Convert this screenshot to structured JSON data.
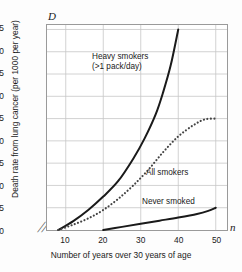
{
  "chart_data": {
    "type": "line",
    "title": "",
    "xlabel": "Number of years over 30 years of age",
    "ylabel": "Death rate from lung cancer (per 1000 per year)",
    "x_symbol": "n",
    "y_symbol": "D",
    "xlim": [
      5,
      53
    ],
    "ylim": [
      0,
      46
    ],
    "xticks": [
      10,
      20,
      30,
      40,
      50
    ],
    "yticks": [
      0,
      5,
      10,
      15,
      20,
      25,
      30,
      35,
      40,
      45
    ],
    "grid": true,
    "legend_position": "inline-annotations",
    "axis_break": "╱╱",
    "series": [
      {
        "name": "Heavy smokers",
        "name_line2": "(>1 pack/day)",
        "style": "solid",
        "color": "#1a1a1a",
        "x": [
          8,
          12,
          16,
          20,
          24,
          28,
          31,
          34,
          36,
          38,
          40
        ],
        "values": [
          0,
          2,
          4.5,
          7.5,
          11,
          16,
          20.5,
          26,
          31,
          37,
          45
        ]
      },
      {
        "name": "All smokers",
        "style": "dotted",
        "color": "#444444",
        "x": [
          8,
          12,
          16,
          20,
          24,
          28,
          32,
          36,
          40,
          44,
          47,
          50
        ],
        "values": [
          0,
          1.2,
          2.6,
          4.5,
          7,
          10,
          13.5,
          17.5,
          21,
          23.5,
          24.8,
          25
        ]
      },
      {
        "name": "Never smoked",
        "style": "solid",
        "color": "#1a1a1a",
        "x": [
          20,
          25,
          30,
          35,
          40,
          45,
          48,
          50
        ],
        "values": [
          0,
          0.7,
          1.4,
          2.1,
          2.8,
          3.6,
          4.3,
          5
        ]
      }
    ]
  }
}
